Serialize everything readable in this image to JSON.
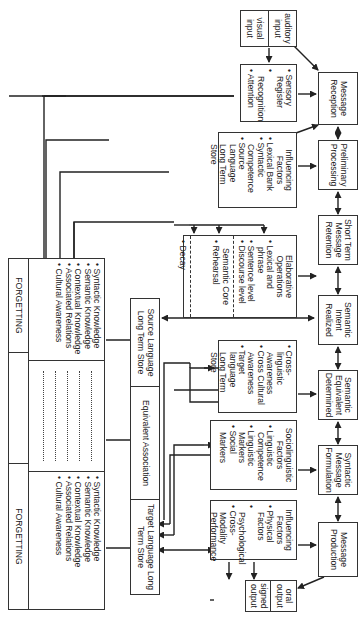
{
  "inputs": {
    "auditory": "auditory input",
    "visual": "visual input"
  },
  "sensory": {
    "items": [
      "Sensory Register",
      "Recognition",
      "Attention"
    ]
  },
  "influencing_top": {
    "title": "Influencing Factors",
    "items": [
      "Lexical Bank",
      "Syntactic Competence",
      "Source Language Long Term Store"
    ]
  },
  "elaborative": {
    "title": "Elaborative Operations",
    "items": [
      "Lexical and phrase",
      "Sentence level",
      "Discourse level"
    ],
    "semantic_core": "Semantic Core",
    "rehearsal": "Rehearsal",
    "decay": "Decay"
  },
  "pipeline": [
    "Message Reception",
    "Preliminary Processing",
    "Short Term Message Retention",
    "Semantic Intent Realized",
    "Semantic Equivalent Determined",
    "Syntactic Message Formulation",
    "Message Production"
  ],
  "cross_linguistic": {
    "items": [
      "Cross-linguistic Awareness",
      "Cross Cultural Awareness",
      "Target language Long Term Store"
    ]
  },
  "sociolinguistic": {
    "title": "Sociolinguistic Factors",
    "items": [
      "Linguistic Competence",
      "Linguistic Markers",
      "Social Markers"
    ]
  },
  "influencing_bottom": {
    "title": "Influencing Factors",
    "items": [
      "Physical Factors",
      "Psychological",
      "Cross-Modality Performance"
    ]
  },
  "outputs": {
    "oral": "oral output",
    "signed": "signed output"
  },
  "stores": {
    "source": "Source Language Long Term Store",
    "equivalent": "Equivalent Association",
    "target": "Target Language Long Term Store"
  },
  "knowledge_table": {
    "forgetting_label": "FORGETTING",
    "source_items": [
      "Syntactic Knowledge",
      "Semantic Knowledge",
      "Contextual Knowledge",
      "Associated Relations",
      "Cultural Awareness"
    ],
    "target_items": [
      "Syntactic Knowledge",
      "Semantic Knowledge",
      "Contextual Knowledge",
      "Associated Relations",
      "Cultural Awareness"
    ]
  }
}
